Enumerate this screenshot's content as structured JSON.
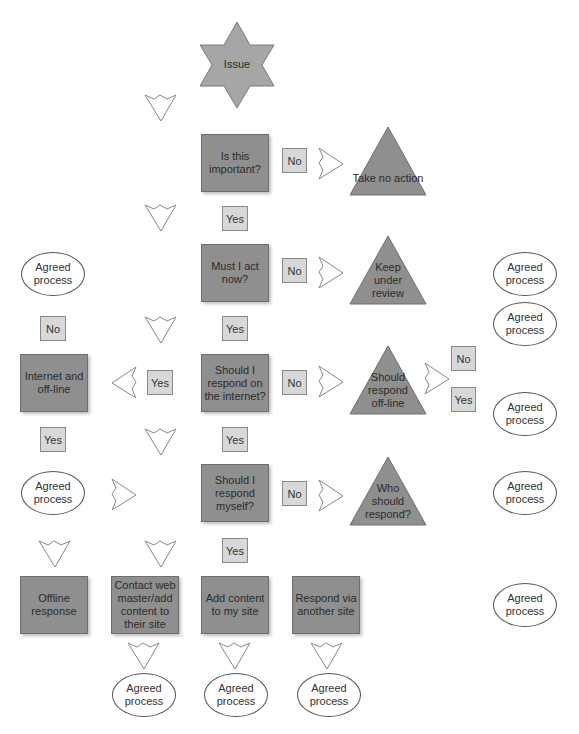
{
  "diagram": {
    "type": "decision-flowchart",
    "colors": {
      "decision_box": "#8f8f8f",
      "label_box": "#d8d8d8",
      "triangle": "#8f8f8f",
      "star": "#a6a6a6",
      "oval_border": "#555555",
      "arrow_stroke": "#888888"
    },
    "start": {
      "label": "Issue"
    },
    "decisions": [
      {
        "id": "important",
        "label": "Is this important?"
      },
      {
        "id": "act_now",
        "label": "Must I act now?"
      },
      {
        "id": "respond_internet",
        "label": "Should I respond on the internet?"
      },
      {
        "id": "respond_myself",
        "label": "Should I respond myself?"
      }
    ],
    "outcomes_triangle": [
      {
        "id": "no_action",
        "label": "Take no action"
      },
      {
        "id": "keep_review",
        "label": "Keep under review"
      },
      {
        "id": "respond_offline",
        "label": "Should respond off-line"
      },
      {
        "id": "who_respond",
        "label": "Who should respond?"
      }
    ],
    "action_boxes": [
      {
        "id": "internet_offline",
        "label": "Internet and off-line"
      },
      {
        "id": "offline_response",
        "label": "Offline response"
      },
      {
        "id": "contact_webmaster",
        "label": "Contact web master/add content to their site"
      },
      {
        "id": "add_content",
        "label": "Add content to my site"
      },
      {
        "id": "respond_other_site",
        "label": "Respond via another site"
      }
    ],
    "labels": {
      "yes": "Yes",
      "no": "No"
    },
    "oval_label": "Agreed process"
  }
}
